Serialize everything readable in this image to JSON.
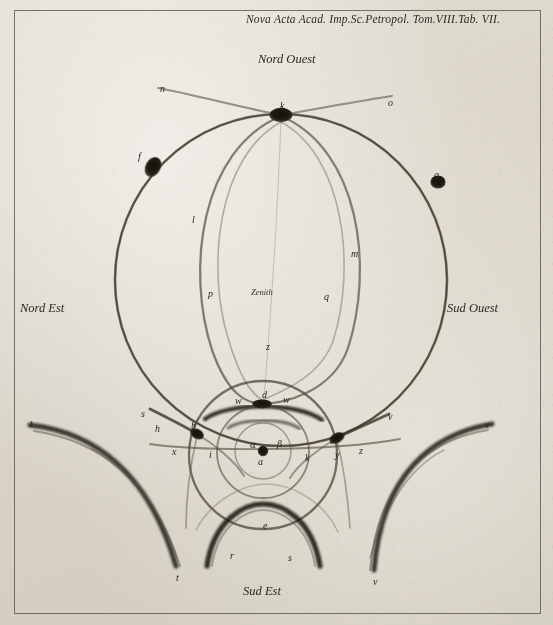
{
  "plate": {
    "title": "Nova Acta Acad. Imp.Sc.Petropol. Tom.VIII.Tab. VII.",
    "zenith_label": "Zenith",
    "paper_color": "#ded8cc",
    "ink_color": "#2b261e"
  },
  "compass": {
    "north_west": "Nord Ouest",
    "north_east": "Nord Est",
    "south_west": "Sud Ouest",
    "south_east": "Sud Est"
  },
  "point_labels": [
    {
      "id": "n",
      "text": "n",
      "x": 160,
      "y": 84
    },
    {
      "id": "o",
      "text": "o",
      "x": 388,
      "y": 98
    },
    {
      "id": "k",
      "text": "k",
      "x": 280,
      "y": 101
    },
    {
      "id": "f",
      "text": "f",
      "x": 138,
      "y": 152
    },
    {
      "id": "g",
      "text": "g",
      "x": 434,
      "y": 170
    },
    {
      "id": "l",
      "text": "l",
      "x": 192,
      "y": 215
    },
    {
      "id": "m",
      "text": "m",
      "x": 351,
      "y": 249
    },
    {
      "id": "p",
      "text": "p",
      "x": 208,
      "y": 289
    },
    {
      "id": "q",
      "text": "q",
      "x": 324,
      "y": 292
    },
    {
      "id": "z",
      "text": "z",
      "x": 266,
      "y": 342
    },
    {
      "id": "d",
      "text": "d",
      "x": 262,
      "y": 390
    },
    {
      "id": "w-left",
      "text": "w",
      "x": 235,
      "y": 396
    },
    {
      "id": "w-right",
      "text": "w",
      "x": 283,
      "y": 395
    },
    {
      "id": "b",
      "text": "b",
      "x": 191,
      "y": 421
    },
    {
      "id": "h",
      "text": "h",
      "x": 155,
      "y": 424
    },
    {
      "id": "s-left",
      "text": "s",
      "x": 141,
      "y": 409
    },
    {
      "id": "x",
      "text": "x",
      "x": 172,
      "y": 447
    },
    {
      "id": "i",
      "text": "i",
      "x": 209,
      "y": 450
    },
    {
      "id": "alpha",
      "text": "α",
      "x": 250,
      "y": 441,
      "greek": true
    },
    {
      "id": "beta",
      "text": "β",
      "x": 277,
      "y": 440,
      "greek": true
    },
    {
      "id": "a",
      "text": "a",
      "x": 258,
      "y": 457
    },
    {
      "id": "k-inner",
      "text": "k",
      "x": 305,
      "y": 453
    },
    {
      "id": "c",
      "text": "c",
      "x": 330,
      "y": 436
    },
    {
      "id": "y",
      "text": "y",
      "x": 335,
      "y": 450
    },
    {
      "id": "z-right",
      "text": "z",
      "x": 359,
      "y": 446
    },
    {
      "id": "v-upper",
      "text": "v",
      "x": 388,
      "y": 412
    },
    {
      "id": "t-outer",
      "text": "t",
      "x": 30,
      "y": 419
    },
    {
      "id": "v-outer",
      "text": "v",
      "x": 485,
      "y": 420
    },
    {
      "id": "t-bottom",
      "text": "t",
      "x": 176,
      "y": 573
    },
    {
      "id": "v-bottom",
      "text": "v",
      "x": 373,
      "y": 577
    },
    {
      "id": "r",
      "text": "r",
      "x": 230,
      "y": 551
    },
    {
      "id": "s-bottom",
      "text": "s",
      "x": 288,
      "y": 553
    },
    {
      "id": "e",
      "text": "e",
      "x": 263,
      "y": 521
    }
  ],
  "figure": {
    "nodes": [
      {
        "id": "k",
        "cx": 281,
        "cy": 115,
        "rx": 11,
        "ry": 7
      },
      {
        "id": "f",
        "cx": 153,
        "cy": 167,
        "rx": 8,
        "ry": 10
      },
      {
        "id": "g",
        "cx": 438,
        "cy": 182,
        "rx": 7.5,
        "ry": 7
      },
      {
        "id": "d",
        "cx": 262,
        "cy": 404,
        "rx": 9,
        "ry": 5
      },
      {
        "id": "b",
        "cx": 197,
        "cy": 434,
        "rx": 7,
        "ry": 5
      },
      {
        "id": "c",
        "cx": 337,
        "cy": 438,
        "rx": 8,
        "ry": 5
      },
      {
        "id": "center",
        "cx": 263,
        "cy": 451,
        "rx": 5,
        "ry": 5
      }
    ],
    "circles": [
      {
        "id": "great-halo",
        "cx": 281,
        "cy": 280,
        "r": 165
      },
      {
        "id": "parhelic-oval",
        "cx": 281,
        "cy": 250,
        "rx": 86,
        "ry": 135
      },
      {
        "id": "middle-halo",
        "cx": 263,
        "cy": 455,
        "r": 74
      },
      {
        "id": "inner-halo",
        "cx": 263,
        "cy": 452,
        "r": 45
      },
      {
        "id": "small-halo",
        "cx": 263,
        "cy": 451,
        "r": 28
      }
    ]
  }
}
